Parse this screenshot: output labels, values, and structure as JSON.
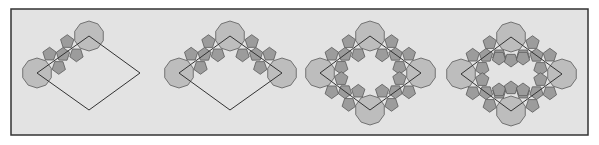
{
  "frame": {
    "x": 11,
    "y": 9,
    "width": 577,
    "height": 126
  },
  "colors": {
    "background": "#e3e3e3",
    "frame_stroke": "#333333",
    "decagon_fill": "#bdbdbd",
    "pentagon_fill": "#9c9c9c",
    "shape_stroke": "#5a5a5a",
    "rhombus_stroke": "#333333"
  },
  "decagon_radius": 15,
  "pentagon_radius": 7,
  "panels": [
    {
      "name": "panel-1",
      "rhombus": {
        "left": [
          37,
          73
        ],
        "top": [
          89,
          36
        ],
        "right": [
          140,
          73
        ],
        "bottom": [
          89,
          110
        ]
      },
      "tiled_edges": [
        "left-top"
      ],
      "decagons": [
        "left",
        "top"
      ],
      "bridge_pentagons": []
    },
    {
      "name": "panel-2",
      "rhombus": {
        "left": [
          179,
          73
        ],
        "top": [
          230,
          36
        ],
        "right": [
          282,
          73
        ],
        "bottom": [
          230,
          110
        ]
      },
      "tiled_edges": [
        "left-top",
        "top-right"
      ],
      "decagons": [
        "left",
        "top",
        "right"
      ],
      "bridge_pentagons": []
    },
    {
      "name": "panel-3",
      "rhombus": {
        "left": [
          320,
          73
        ],
        "top": [
          370,
          36
        ],
        "right": [
          421,
          73
        ],
        "bottom": [
          370,
          110
        ]
      },
      "tiled_edges": [
        "left-top",
        "top-right",
        "right-bottom",
        "bottom-left"
      ],
      "decagons": [
        "left",
        "top",
        "right",
        "bottom"
      ],
      "bridge_pentagons": []
    },
    {
      "name": "panel-4",
      "rhombus": {
        "left": [
          461,
          74
        ],
        "top": [
          511,
          37
        ],
        "right": [
          562,
          74
        ],
        "bottom": [
          511,
          111
        ]
      },
      "tiled_edges": [
        "left-top",
        "top-right",
        "right-bottom",
        "bottom-left"
      ],
      "decagons": [
        "left",
        "top",
        "right",
        "bottom"
      ],
      "bridge_pentagons": [
        [
          499,
          58
        ],
        [
          511,
          60
        ],
        [
          523,
          58
        ],
        [
          499,
          90
        ],
        [
          511,
          88
        ],
        [
          523,
          90
        ]
      ]
    }
  ]
}
